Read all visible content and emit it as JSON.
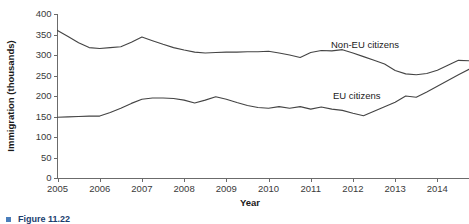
{
  "chart_data": {
    "type": "line",
    "title": "",
    "xlabel": "Year",
    "ylabel": "Immigration (thousands)",
    "xlim": [
      2005.0,
      2014.75
    ],
    "ylim": [
      0,
      400
    ],
    "ytick_step": 50,
    "yticks": [
      0,
      50,
      100,
      150,
      200,
      250,
      300,
      350,
      400
    ],
    "ytick_labels": [
      "0",
      "50",
      "100",
      "150",
      "200",
      "250",
      "300",
      "350",
      "400"
    ],
    "xticks": [
      2005,
      2006,
      2007,
      2008,
      2009,
      2010,
      2011,
      2012,
      2013,
      2014
    ],
    "xtick_labels": [
      "2005",
      "2006",
      "2007",
      "2008",
      "2009",
      "2010",
      "2011",
      "2012",
      "2013",
      "2014"
    ],
    "grid": false,
    "legend_position": "inline-annotation",
    "line_color": "#444444",
    "x": [
      2005.0,
      2005.25,
      2005.5,
      2005.75,
      2006.0,
      2006.25,
      2006.5,
      2006.75,
      2007.0,
      2007.25,
      2007.5,
      2007.75,
      2008.0,
      2008.25,
      2008.5,
      2008.75,
      2009.0,
      2009.25,
      2009.5,
      2009.75,
      2010.0,
      2010.25,
      2010.5,
      2010.75,
      2011.0,
      2011.25,
      2011.5,
      2011.75,
      2012.0,
      2012.25,
      2012.5,
      2012.75,
      2013.0,
      2013.25,
      2013.5,
      2013.75,
      2014.0,
      2014.25,
      2014.5,
      2014.75
    ],
    "series": [
      {
        "name": "Non-EU citizens",
        "label_text": "Non-EU citizens",
        "values": [
          360,
          345,
          330,
          318,
          316,
          318,
          320,
          331,
          344,
          335,
          326,
          318,
          312,
          307,
          305,
          306,
          307,
          307,
          308,
          308,
          309,
          305,
          300,
          294,
          306,
          311,
          310,
          313,
          305,
          296,
          287,
          278,
          262,
          254,
          252,
          255,
          263,
          275,
          287,
          286
        ]
      },
      {
        "name": "EU citizens",
        "label_text": "EU citizens",
        "values": [
          148,
          149,
          150,
          151,
          151,
          160,
          170,
          182,
          192,
          195,
          195,
          194,
          190,
          183,
          190,
          198,
          192,
          184,
          177,
          172,
          170,
          174,
          170,
          174,
          168,
          173,
          168,
          165,
          158,
          152,
          163,
          174,
          185,
          200,
          197,
          210,
          224,
          238,
          252,
          265
        ]
      }
    ],
    "series_annotations": [
      {
        "name": "Non-EU citizens",
        "x_px": 331,
        "y_px": 48
      },
      {
        "name": "EU citizens",
        "x_px": 333,
        "y_px": 99
      }
    ]
  },
  "caption": {
    "text": "Figure 11.22"
  }
}
